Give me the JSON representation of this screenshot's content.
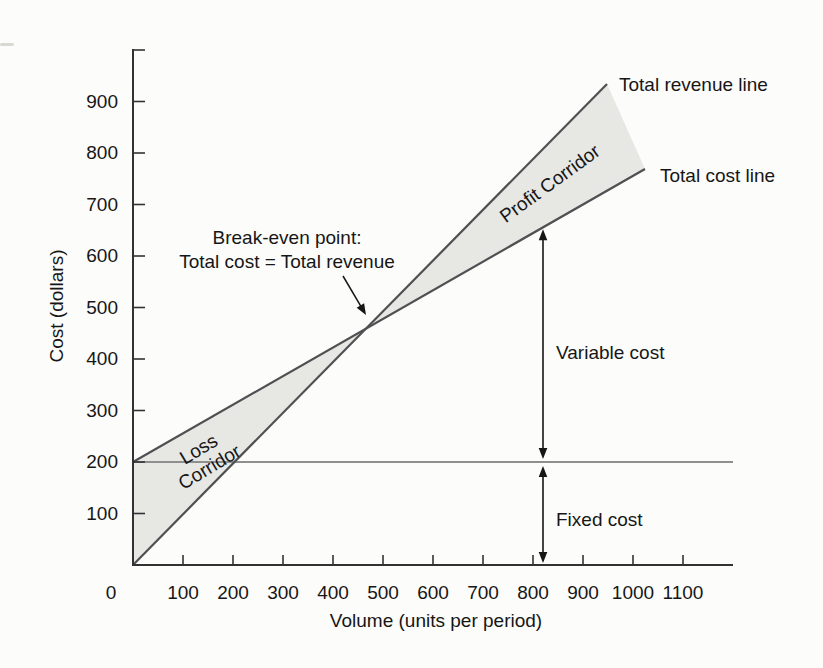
{
  "chart_data": {
    "type": "line",
    "title": "",
    "xlabel": "Volume (units per period)",
    "ylabel": "Cost (dollars)",
    "xlim": [
      0,
      1200
    ],
    "ylim": [
      0,
      1000
    ],
    "x_ticks": [
      0,
      100,
      200,
      300,
      400,
      500,
      600,
      700,
      800,
      900,
      1000,
      1100
    ],
    "y_ticks": [
      100,
      200,
      300,
      400,
      500,
      600,
      700,
      800,
      900
    ],
    "y_axis_top_tick": 1000,
    "grid": false,
    "series": [
      {
        "name": "total-revenue-line",
        "label": "Total revenue line",
        "points": [
          [
            0,
            0
          ],
          [
            948,
            934
          ]
        ],
        "color": "#505052",
        "width": 2.2
      },
      {
        "name": "total-cost-line",
        "label": "Total cost line",
        "points": [
          [
            0,
            200
          ],
          [
            1024,
            769
          ]
        ],
        "color": "#505052",
        "width": 2.2
      },
      {
        "name": "fixed-cost-line",
        "label": "",
        "points": [
          [
            0,
            200
          ],
          [
            1200,
            200
          ]
        ],
        "color": "#8f8f90",
        "width": 2
      }
    ],
    "fixed_cost_value": 200,
    "break_even": {
      "volume": 470,
      "cost": 465,
      "label_lines": [
        "Break-even point:",
        "Total cost = Total revenue"
      ],
      "pointer_arrow_px": {
        "from": [
          343,
          276
        ],
        "to": [
          366,
          315
        ]
      }
    },
    "regions": [
      {
        "name": "loss-corridor",
        "label": "Loss Corridor",
        "label_lines": [
          "Loss",
          "Corridor"
        ],
        "side": "left-of-break-even"
      },
      {
        "name": "profit-corridor",
        "label": "Profit Corridor",
        "side": "right-of-break-even"
      }
    ],
    "measures": [
      {
        "name": "variable-cost-measure",
        "label": "Variable cost",
        "at_volume": 820,
        "from": "total-cost-line",
        "to": "fixed-cost-line"
      },
      {
        "name": "fixed-cost-measure",
        "label": "Fixed cost",
        "at_volume": 820,
        "from": "fixed-cost-line",
        "to": "x-axis"
      }
    ],
    "colors": {
      "background": "#fcfcfa",
      "axis": "#323234",
      "line": "#505052",
      "fixed_line": "#8f8f90",
      "region_fill": "#e7e7e4",
      "arrow": "#161616",
      "text": "#161616"
    },
    "legend": "none"
  }
}
